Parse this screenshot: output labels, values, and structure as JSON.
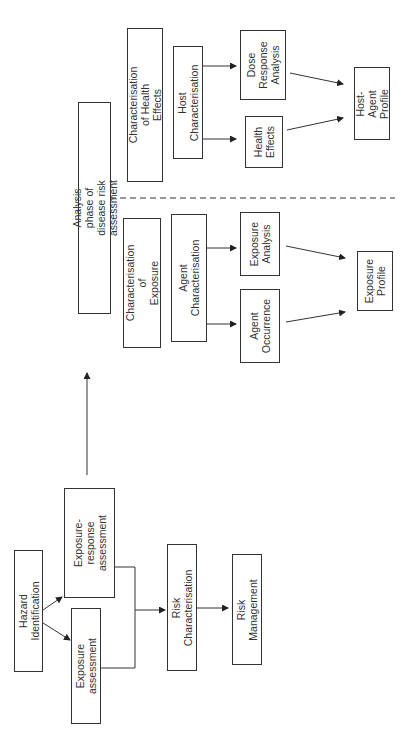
{
  "diagram": {
    "title": "Analysis phase of disease risk assessment",
    "left_flow": {
      "hazard_identification": "Hazard Identification",
      "exposure_assessment": "Exposure\nassessment",
      "exposure_response_assessment": "Exposure-response\nassessment",
      "risk_characterisation": "Risk Characterisation",
      "risk_management": "Risk Management"
    },
    "exposure_branch": {
      "header": "Characterisation of\nExposure",
      "agent_characterisation": "Agent Characterisation",
      "agent_occurrence": "Agent\nOccurrence",
      "exposure_analysis": "Exposure\nAnalysis",
      "exposure_profile": "Exposure\nProfile"
    },
    "health_branch": {
      "header": "Characterisation of Health\nEffects",
      "host_characterisation": "Host\nCharacterisation",
      "health_effects": "Health\nEffects",
      "dose_response_analysis": "Dose\nResponse\nAnalysis",
      "host_agent_profile": "Host-Agent\nProfile"
    },
    "colors": {
      "line": "#333333",
      "background": "#ffffff"
    }
  }
}
